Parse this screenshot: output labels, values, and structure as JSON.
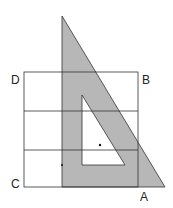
{
  "diagram": {
    "type": "geometry",
    "labels": {
      "A": "A",
      "B": "B",
      "C": "C",
      "D": "D"
    },
    "colors": {
      "triangle_fill": "#b7b7b7",
      "line": "#333333",
      "background": "#ffffff"
    }
  }
}
